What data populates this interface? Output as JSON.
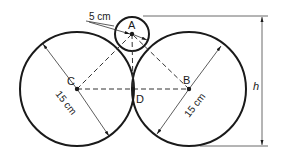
{
  "diagram": {
    "points": {
      "A": {
        "label": "A",
        "x": 132,
        "y": 34
      },
      "B": {
        "label": "B",
        "x": 189,
        "y": 89
      },
      "C": {
        "label": "C",
        "x": 77,
        "y": 89
      },
      "D": {
        "label": "D",
        "x": 133,
        "y": 89
      }
    },
    "circles": [
      {
        "name": "small-circle-A",
        "cx": 132,
        "cy": 34,
        "r": 17
      },
      {
        "name": "large-circle-C",
        "cx": 77,
        "cy": 89,
        "r": 57
      },
      {
        "name": "large-circle-B",
        "cx": 189,
        "cy": 89,
        "r": 57
      }
    ],
    "dimensions": {
      "small_radius": "5 cm",
      "left_radius": "15 cm",
      "right_radius": "15 cm",
      "height": "h"
    },
    "colors": {
      "stroke": "#1a1a1a",
      "thin": "#333333"
    }
  }
}
